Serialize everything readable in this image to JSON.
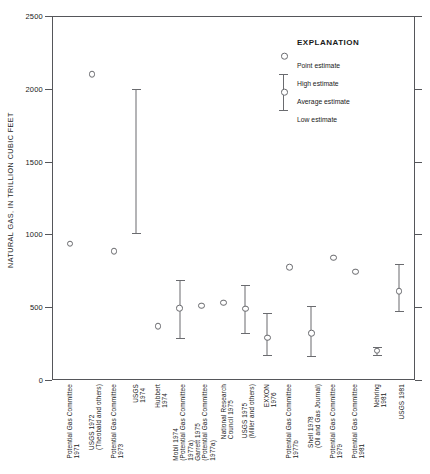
{
  "chart_data": {
    "type": "scatter",
    "title": "",
    "xlabel": "",
    "ylabel": "NATURAL GAS, IN TRILLION CUBIC FEET",
    "ylim": [
      0,
      2500
    ],
    "yticks": [
      0,
      500,
      1000,
      1500,
      2000,
      2500
    ],
    "ytick_labels": [
      "0",
      "500",
      "1000",
      "1500",
      "2000",
      "2500"
    ],
    "grid": false,
    "legend_position": "upper right",
    "categories": [
      "Potential Gas Committee 1971",
      "USGS 1972 (Theobald and others)",
      "Potential Gas Committee 1973",
      "USGS 1974",
      "Hubbert 1974",
      "Mobil 1974 (Potential Gas Committee 1977a)",
      "Garrett 1975 (Potential Gas Committee 1977a)",
      "National Research Council 1975",
      "USGS 1975 (Miller and others)",
      "EXXON 1976",
      "Potential Gas Committee 1977b",
      "Shell 1978 (Oil and Gas Journal)",
      "Potential Gas Committee 1979",
      "Potential Gas Committee 1981",
      "Nehring 1981",
      "USGS 1981"
    ],
    "points": [
      {
        "label": "Potential Gas Committee 1971",
        "estimate": 935,
        "high": null,
        "low": null,
        "kind": "point"
      },
      {
        "label": "USGS 1972 (Theobald and others)",
        "estimate": 2100,
        "high": null,
        "low": null,
        "kind": "point"
      },
      {
        "label": "Potential Gas Committee 1973",
        "estimate": 885,
        "high": null,
        "low": null,
        "kind": "point"
      },
      {
        "label": "USGS 1974",
        "estimate": null,
        "high": 2000,
        "low": 1010,
        "kind": "range"
      },
      {
        "label": "Hubbert 1974",
        "estimate": 370,
        "high": null,
        "low": null,
        "kind": "point"
      },
      {
        "label": "Mobil 1974 (Potential Gas Committee 1977a)",
        "estimate": 495,
        "high": 690,
        "low": 290,
        "kind": "range-avg"
      },
      {
        "label": "Garrett 1975 (Potential Gas Committee 1977a)",
        "estimate": 510,
        "high": null,
        "low": null,
        "kind": "point"
      },
      {
        "label": "National Research Council 1975",
        "estimate": 530,
        "high": null,
        "low": null,
        "kind": "point"
      },
      {
        "label": "USGS 1975 (Miller and others)",
        "estimate": 490,
        "high": 655,
        "low": 325,
        "kind": "range-avg"
      },
      {
        "label": "EXXON 1976",
        "estimate": 290,
        "high": 460,
        "low": 170,
        "kind": "range-avg"
      },
      {
        "label": "Potential Gas Committee 1977b",
        "estimate": 775,
        "high": null,
        "low": null,
        "kind": "point"
      },
      {
        "label": "Shell 1978 (Oil and Gas Journal)",
        "estimate": 320,
        "high": 510,
        "low": 165,
        "kind": "range-avg"
      },
      {
        "label": "Potential Gas Committee 1979",
        "estimate": 840,
        "high": null,
        "low": null,
        "kind": "point"
      },
      {
        "label": "Potential Gas Committee 1981",
        "estimate": 745,
        "high": null,
        "low": null,
        "kind": "point"
      },
      {
        "label": "Nehring 1981",
        "estimate": 200,
        "high": 225,
        "low": 175,
        "kind": "range-avg"
      },
      {
        "label": "USGS 1981",
        "estimate": 610,
        "high": 800,
        "low": 475,
        "kind": "range-avg"
      }
    ]
  },
  "x_labels": [
    {
      "lines": [
        "Potential Gas Committee",
        "1971"
      ]
    },
    {
      "lines": [
        "USGS 1972",
        "(Theobald and others)"
      ]
    },
    {
      "lines": [
        "Potential Gas Committee",
        "1973"
      ]
    },
    {
      "lines": [
        "USGS",
        "1974"
      ]
    },
    {
      "lines": [
        "Hubbert",
        "1974"
      ]
    },
    {
      "lines": [
        "Mobil 1974",
        "(Potential Gas Committee",
        "1977a)"
      ]
    },
    {
      "lines": [
        "Garrett 1975",
        "(Potential Gas Committee",
        "1977a)"
      ]
    },
    {
      "lines": [
        "National Research",
        "Council 1975"
      ]
    },
    {
      "lines": [
        "USGS 1975",
        "(Miller and others)"
      ]
    },
    {
      "lines": [
        "EXXON",
        "1976"
      ]
    },
    {
      "lines": [
        "Potential Gas Committee",
        "1977b"
      ]
    },
    {
      "lines": [
        "Shell 1978",
        "(Oil and Gas Journal)"
      ]
    },
    {
      "lines": [
        "Potential Gas Committee",
        "1979"
      ]
    },
    {
      "lines": [
        "Potential Gas Committee",
        "1981"
      ]
    },
    {
      "lines": [
        "Nehring",
        "1981"
      ]
    },
    {
      "lines": [
        "USGS 1981"
      ]
    }
  ],
  "legend": {
    "title": "EXPLANATION",
    "items": [
      {
        "label": "Point estimate",
        "marker": "open-circle-icon"
      },
      {
        "label": "High estimate",
        "marker": "upper-cap-icon"
      },
      {
        "label": "Average estimate",
        "marker": "open-circle-icon"
      },
      {
        "label": "Low estimate",
        "marker": "lower-cap-icon"
      }
    ]
  },
  "colors": {
    "axis": "#55565a",
    "marker": "#6a6b6f",
    "text": "#1a1a1a",
    "background": "#ffffff"
  }
}
